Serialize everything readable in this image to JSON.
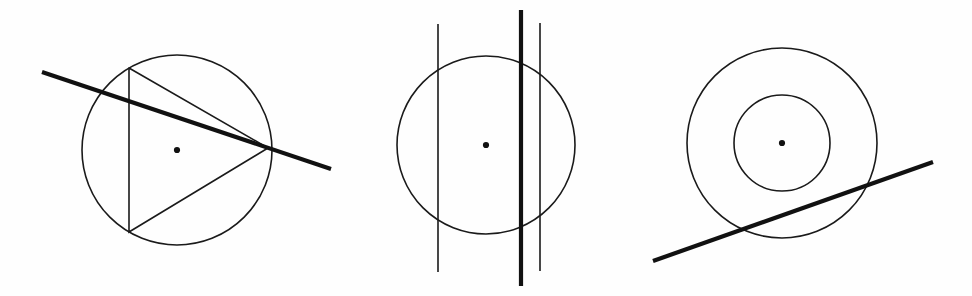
{
  "page": {
    "background_color": "#ffffff",
    "stroke_color": "#1a1a1a",
    "thick_stroke_color": "#111111",
    "width": 972,
    "height": 296,
    "figure_count": 3
  },
  "chart_data": {
    "type": "diagram",
    "xlabel": "",
    "ylabel": "",
    "grid": false,
    "legend": "none",
    "xlim": [
      0,
      972
    ],
    "ylim": [
      0,
      296
    ],
    "figures": [
      {
        "id": "figure-1",
        "name": "circle-with-inscribed-triangle-and-secant",
        "description": "Circle with inscribed triangle and a thick secant line crossing it",
        "circles": [
          {
            "name": "main-circle",
            "cx": 177,
            "cy": 150,
            "r": 95,
            "stroke_width": 1.6
          }
        ],
        "center_dot": {
          "cx": 177,
          "cy": 150,
          "r": 3.1
        },
        "polylines": [
          {
            "name": "inscribed-triangle",
            "points": [
              [
                129,
                68
              ],
              [
                268,
                148
              ],
              [
                129,
                232
              ],
              [
                129,
                68
              ]
            ],
            "stroke_width": 1.6,
            "closed": true
          }
        ],
        "lines": [
          {
            "name": "secant-line",
            "x1": 42,
            "y1": 72,
            "x2": 331,
            "y2": 169,
            "stroke_width": 4.0
          }
        ]
      },
      {
        "id": "figure-2",
        "name": "circle-with-three-vertical-lines",
        "description": "Circle crossed by two thin vertical lines and one thick vertical line",
        "circles": [
          {
            "name": "main-circle",
            "cx": 486,
            "cy": 145,
            "r": 89,
            "stroke_width": 1.6
          }
        ],
        "center_dot": {
          "cx": 486,
          "cy": 145,
          "r": 3.1
        },
        "polylines": [],
        "lines": [
          {
            "name": "vertical-line-left-thin",
            "x1": 438,
            "y1": 24,
            "x2": 438,
            "y2": 272,
            "stroke_width": 1.6
          },
          {
            "name": "vertical-line-center-thick",
            "x1": 521,
            "y1": 10,
            "x2": 521,
            "y2": 286,
            "stroke_width": 4.2
          },
          {
            "name": "vertical-line-right-thin",
            "x1": 540,
            "y1": 23,
            "x2": 540,
            "y2": 271,
            "stroke_width": 1.6
          }
        ]
      },
      {
        "id": "figure-3",
        "name": "concentric-circles-with-secant",
        "description": "Two concentric circles cut by a thick rising secant line near the bottom",
        "circles": [
          {
            "name": "outer-circle",
            "cx": 782,
            "cy": 143,
            "r": 95,
            "stroke_width": 1.6
          },
          {
            "name": "inner-circle",
            "cx": 782,
            "cy": 143,
            "r": 48,
            "stroke_width": 1.6
          }
        ],
        "center_dot": {
          "cx": 782,
          "cy": 143,
          "r": 3.1
        },
        "polylines": [],
        "lines": [
          {
            "name": "secant-line",
            "x1": 653,
            "y1": 261,
            "x2": 933,
            "y2": 162,
            "stroke_width": 4.2
          }
        ]
      }
    ]
  }
}
